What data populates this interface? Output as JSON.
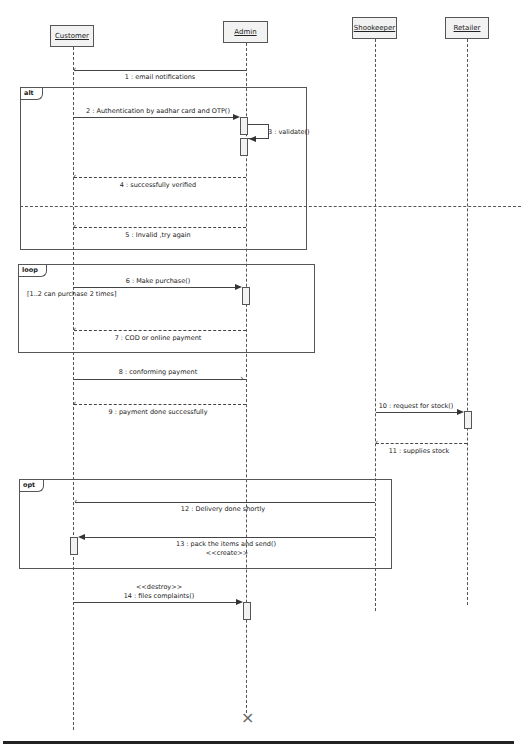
{
  "diagram": {
    "type": "UML sequence diagram",
    "lifelines": [
      {
        "name": "Customer",
        "x": 73
      },
      {
        "name": "Admin",
        "x": 246
      },
      {
        "name": "Shookeeper",
        "x": 375
      },
      {
        "name": "Retailer",
        "x": 467
      }
    ],
    "fragments": {
      "alt": {
        "tag": "alt"
      },
      "loop": {
        "tag": "loop",
        "guard": "[1..2 can purchase 2 times]"
      },
      "opt": {
        "tag": "opt"
      }
    },
    "messages": [
      {
        "id": 1,
        "label": "1 : email notifications",
        "from": "Admin",
        "to": "Customer",
        "kind": "async"
      },
      {
        "id": 2,
        "label": "2 : Authentication by aadhar card and OTP()",
        "from": "Customer",
        "to": "Admin",
        "kind": "sync"
      },
      {
        "id": 3,
        "label": "3 : validate()",
        "from": "Admin",
        "to": "Admin",
        "kind": "self"
      },
      {
        "id": 4,
        "label": "4 : successfully verified",
        "from": "Admin",
        "to": "Customer",
        "kind": "reply"
      },
      {
        "id": 5,
        "label": "5 : Invalid ,try again",
        "from": "Admin",
        "to": "Customer",
        "kind": "reply"
      },
      {
        "id": 6,
        "label": "6 : Make purchase()",
        "from": "Customer",
        "to": "Admin",
        "kind": "sync"
      },
      {
        "id": 7,
        "label": "7 : COD or online payment",
        "from": "Admin",
        "to": "Customer",
        "kind": "reply"
      },
      {
        "id": 8,
        "label": "8 : conforming payment",
        "from": "Customer",
        "to": "Admin",
        "kind": "async"
      },
      {
        "id": 9,
        "label": "9 : payment done successfully",
        "from": "Admin",
        "to": "Customer",
        "kind": "reply"
      },
      {
        "id": 10,
        "label": "10 : request for stock()",
        "from": "Shookeeper",
        "to": "Retailer",
        "kind": "sync"
      },
      {
        "id": 11,
        "label": "11 : supplies stock",
        "from": "Retailer",
        "to": "Shookeeper",
        "kind": "reply"
      },
      {
        "id": 12,
        "label": "12 : Delivery done shortly",
        "from": "Shookeeper",
        "to": "Customer",
        "kind": "async"
      },
      {
        "id": 13,
        "label": "13 : pack the items and send()",
        "stereotype": "<<create>>",
        "from": "Shookeeper",
        "to": "Customer",
        "kind": "sync"
      },
      {
        "id": 14,
        "label": "14 : files complaints()",
        "stereotype": "<<destroy>>",
        "from": "Customer",
        "to": "Admin",
        "kind": "sync"
      }
    ],
    "destroy_marker": "×"
  }
}
